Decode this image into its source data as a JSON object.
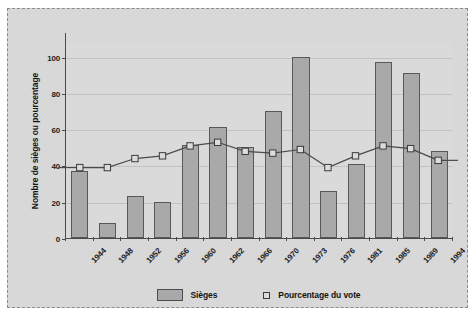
{
  "chart_data": {
    "type": "bar",
    "title": "",
    "xlabel": "",
    "ylabel": "Nombre de sièges ou pourcentage",
    "ylim": [
      0,
      100
    ],
    "yticks": [
      0,
      20,
      40,
      60,
      80,
      100
    ],
    "grid": true,
    "legend_position": "bottom",
    "categories": [
      "1944",
      "1948",
      "1952",
      "1956",
      "1960",
      "1962",
      "1966",
      "1970",
      "1973",
      "1976",
      "1981",
      "1985",
      "1989",
      "1994"
    ],
    "series": [
      {
        "name": "Sièges",
        "type": "bar",
        "values": [
          37,
          8,
          23,
          20,
          51,
          61,
          50,
          70,
          100,
          26,
          41,
          97,
          91,
          48
        ]
      },
      {
        "name": "Pourcentage du vote",
        "type": "line",
        "marker": "open-square",
        "values": [
          39,
          39,
          44,
          45.5,
          51,
          53,
          48,
          47,
          49,
          39,
          45.5,
          51,
          49.5,
          43
        ]
      }
    ]
  },
  "legend": {
    "items": [
      {
        "label": "Sièges",
        "marker": "filled-rectangle",
        "color": "#a9a9a9"
      },
      {
        "label": "Pourcentage du vote",
        "marker": "open-square",
        "color": "#dcdcdc"
      }
    ]
  },
  "colors": {
    "page_background": "#ffffff",
    "panel_background": "#d8d8d8",
    "plot_background": "#dadada",
    "bar_fill": "#a9a9a9",
    "bar_border": "#585858",
    "gridline": "#c2c2c2",
    "axis": "#4a4a4a",
    "line": "#4a4a4a",
    "text": "#1c1c1c",
    "frame_border": "#8b8b8b"
  }
}
